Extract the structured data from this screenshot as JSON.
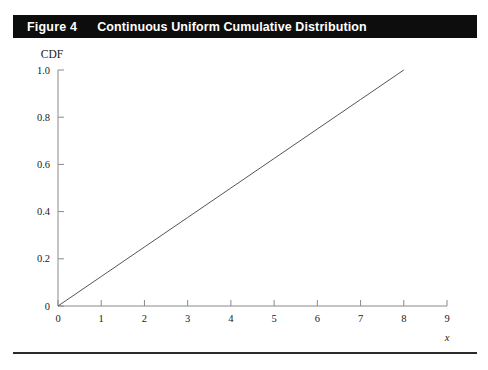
{
  "figure": {
    "number_label": "Figure 4",
    "caption": "Continuous Uniform Cumulative Distribution"
  },
  "chart_data": {
    "type": "line",
    "title": "Continuous Uniform Cumulative Distribution",
    "xlabel": "x",
    "ylabel": "CDF",
    "xlim": [
      0,
      9
    ],
    "ylim": [
      0,
      1.0
    ],
    "grid": false,
    "legend": "none",
    "x_ticks": [
      0,
      1,
      2,
      3,
      4,
      5,
      6,
      7,
      8,
      9
    ],
    "x_tick_labels": [
      "0",
      "1",
      "2",
      "3",
      "4",
      "5",
      "6",
      "7",
      "8",
      "9"
    ],
    "y_ticks": [
      0,
      0.2,
      0.4,
      0.6,
      0.8,
      1.0
    ],
    "y_tick_labels": [
      "0",
      "0.2",
      "0.4",
      "0.6",
      "0.8",
      "1.0"
    ],
    "series": [
      {
        "name": "CDF",
        "x": [
          0,
          1,
          2,
          3,
          4,
          5,
          6,
          7,
          8
        ],
        "values": [
          0,
          0.125,
          0.25,
          0.375,
          0.5,
          0.625,
          0.75,
          0.875,
          1.0
        ],
        "color": "#555555",
        "line_width": 1
      }
    ]
  },
  "axis_labels": {
    "y": "CDF",
    "x": "x"
  }
}
